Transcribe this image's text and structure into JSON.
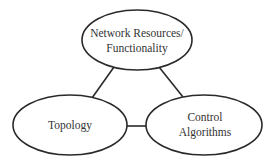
{
  "diagram": {
    "type": "triangle-of-concepts",
    "nodes": [
      {
        "id": "resources",
        "lines": [
          "Network Resources/",
          "Functionality"
        ]
      },
      {
        "id": "topology",
        "lines": [
          "Topology"
        ]
      },
      {
        "id": "control",
        "lines": [
          "Control",
          "Algorithms"
        ]
      }
    ],
    "edges": [
      {
        "from": "resources",
        "to": "topology"
      },
      {
        "from": "resources",
        "to": "control"
      },
      {
        "from": "topology",
        "to": "control"
      }
    ],
    "colors": {
      "stroke": "#2a2a2a",
      "text": "#333333",
      "background": "#ffffff"
    }
  }
}
